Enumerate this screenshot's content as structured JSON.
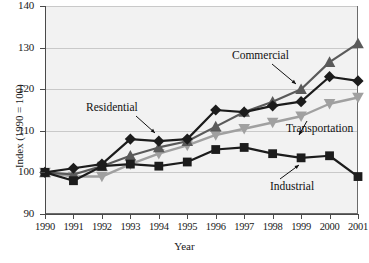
{
  "chart_data": {
    "type": "line",
    "title": "",
    "xlabel": "Year",
    "ylabel": "Index (1990 = 100)",
    "x": [
      1990,
      1991,
      1992,
      1993,
      1994,
      1995,
      1996,
      1997,
      1998,
      1999,
      2000,
      2001
    ],
    "xtick_labels": [
      "1990",
      "1991",
      "1992",
      "1993",
      "1994",
      "1995",
      "1996",
      "1997",
      "1998",
      "1999",
      "2000",
      "2001"
    ],
    "ytick_labels": [
      "90",
      "100",
      "110",
      "120",
      "130",
      "140"
    ],
    "ylim": [
      90,
      140
    ],
    "ytick_values": [
      90,
      100,
      110,
      120,
      130,
      140
    ],
    "xlim": [
      1990,
      2001
    ],
    "grid": "horizontal",
    "legend_position": "inline-annotations",
    "series": [
      {
        "name": "Residential",
        "marker": "diamond",
        "color": "#1c1c1c",
        "values": [
          100,
          101,
          102,
          108,
          107.5,
          108,
          115,
          114.5,
          116,
          117,
          123,
          122
        ]
      },
      {
        "name": "Commercial",
        "marker": "triangle-up",
        "color": "#5a5a5a",
        "values": [
          100,
          99.5,
          101.5,
          104,
          106,
          107.5,
          111,
          114.5,
          117,
          120,
          126.5,
          131
        ]
      },
      {
        "name": "Transportation",
        "marker": "triangle-down",
        "color": "#a0a0a0",
        "values": [
          100,
          99,
          99,
          102,
          104.5,
          106.5,
          109,
          110.5,
          112,
          113.5,
          116.5,
          118
        ]
      },
      {
        "name": "Industrial",
        "marker": "square",
        "color": "#1c1c1c",
        "values": [
          100,
          98,
          101.5,
          102,
          101.5,
          102.5,
          105.5,
          106,
          104.5,
          103.5,
          104,
          99
        ]
      }
    ],
    "annotations": [
      {
        "text": "Residential",
        "points_to": "Residential series at 1994"
      },
      {
        "text": "Commercial",
        "points_to": "Commercial series at 1998"
      },
      {
        "text": "Transportation",
        "points_to": "Transportation series at 2000"
      },
      {
        "text": "Industrial",
        "points_to": "Industrial series at 2000"
      }
    ]
  }
}
